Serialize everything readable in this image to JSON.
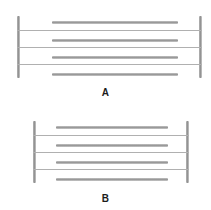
{
  "figure": {
    "name": "two-panel-ladder-diagram",
    "background_color": "#ffffff",
    "post_color": "#8e8e8e",
    "bar_color": "#999999",
    "rung_color": "#b0b0b0",
    "label_color": "#1c1c1c"
  },
  "panels": [
    {
      "id": "A",
      "label": "A",
      "frame": {
        "left_post_x": 17,
        "right_post_x": 199,
        "post_top": 16,
        "post_bottom": 78,
        "post_width": 3,
        "width": 185
      },
      "rungs": [
        {
          "index": 0,
          "y": 30,
          "x1": 17,
          "x2": 202
        },
        {
          "index": 1,
          "y": 47,
          "x1": 17,
          "x2": 202
        },
        {
          "index": 2,
          "y": 64,
          "x1": 17,
          "x2": 202
        }
      ],
      "bars": [
        {
          "index": 0,
          "y": 21,
          "x1": 52,
          "x2": 178
        },
        {
          "index": 1,
          "y": 39,
          "x1": 52,
          "x2": 178
        },
        {
          "index": 2,
          "y": 56,
          "x1": 52,
          "x2": 178
        },
        {
          "index": 3,
          "y": 73,
          "x1": 52,
          "x2": 178
        }
      ]
    },
    {
      "id": "B",
      "label": "B",
      "frame": {
        "left_post_x": 33,
        "right_post_x": 186,
        "post_top": 16,
        "post_bottom": 78,
        "post_width": 3,
        "width": 156
      },
      "rungs": [
        {
          "index": 0,
          "y": 30,
          "x1": 33,
          "x2": 189
        },
        {
          "index": 1,
          "y": 47,
          "x1": 33,
          "x2": 189
        },
        {
          "index": 2,
          "y": 64,
          "x1": 33,
          "x2": 189
        }
      ],
      "bars": [
        {
          "index": 0,
          "y": 21,
          "x1": 56,
          "x2": 168
        },
        {
          "index": 1,
          "y": 39,
          "x1": 56,
          "x2": 168
        },
        {
          "index": 2,
          "y": 56,
          "x1": 56,
          "x2": 168
        },
        {
          "index": 3,
          "y": 73,
          "x1": 56,
          "x2": 168
        }
      ]
    }
  ]
}
